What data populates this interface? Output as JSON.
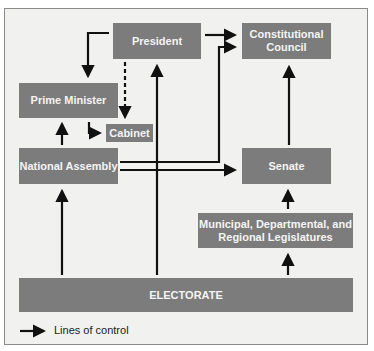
{
  "diagram": {
    "nodes": {
      "president": "President",
      "constitutional_council_line1": "Constitutional",
      "constitutional_council_line2": "Council",
      "prime_minister": "Prime Minister",
      "cabinet": "Cabinet",
      "national_assembly": "National Assembly",
      "senate": "Senate",
      "local_line1": "Municipal, Departmental, and",
      "local_line2": "Regional Legislatures",
      "electorate": "ELECTORATE"
    },
    "edges": [
      {
        "from": "President",
        "to": "Prime Minister",
        "style": "solid"
      },
      {
        "from": "President",
        "to": "Cabinet",
        "style": "dotted"
      },
      {
        "from": "President",
        "to": "Constitutional Council",
        "style": "solid"
      },
      {
        "from": "Prime Minister",
        "to": "Cabinet",
        "style": "solid"
      },
      {
        "from": "National Assembly",
        "to": "Prime Minister",
        "style": "solid"
      },
      {
        "from": "National Assembly",
        "to": "Constitutional Council",
        "style": "solid"
      },
      {
        "from": "National Assembly",
        "to": "Senate",
        "style": "solid"
      },
      {
        "from": "Senate",
        "to": "Constitutional Council",
        "style": "solid"
      },
      {
        "from": "Municipal, Departmental, and Regional Legislatures",
        "to": "Senate",
        "style": "solid"
      },
      {
        "from": "Electorate",
        "to": "National Assembly",
        "style": "solid"
      },
      {
        "from": "Electorate",
        "to": "President",
        "style": "solid"
      },
      {
        "from": "Electorate",
        "to": "Municipal, Departmental, and Regional Legislatures",
        "style": "solid"
      }
    ],
    "legend": {
      "label": "Lines of control"
    }
  }
}
